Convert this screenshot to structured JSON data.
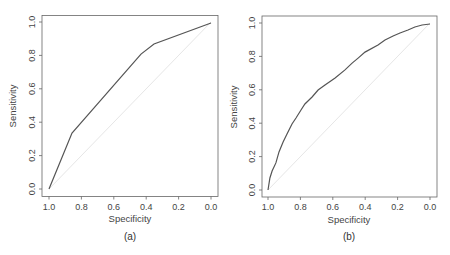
{
  "chart_data": [
    {
      "type": "line",
      "panel": "a",
      "caption": "(a)",
      "title": "",
      "xlabel": "Specificity",
      "ylabel": "Sensitivity",
      "xlim": [
        1.0,
        0.0
      ],
      "ylim": [
        0.0,
        1.0
      ],
      "x_reversed": true,
      "xticks": [
        "1.0",
        "0.8",
        "0.6",
        "0.4",
        "0.2",
        "0.0"
      ],
      "yticks": [
        "0.0",
        "0.2",
        "0.4",
        "0.6",
        "0.8",
        "1.0"
      ],
      "grid": false,
      "reference_line": {
        "from": [
          1.0,
          0.0
        ],
        "to": [
          0.0,
          1.0
        ],
        "color": "#e6e6e6"
      },
      "series": [
        {
          "name": "ROC",
          "color": "#555555",
          "specificity": [
            1.0,
            0.858,
            0.432,
            0.352,
            0.0
          ],
          "sensitivity": [
            0.0,
            0.335,
            0.808,
            0.868,
            0.994
          ]
        }
      ]
    },
    {
      "type": "line",
      "panel": "b",
      "caption": "(b)",
      "title": "",
      "xlabel": "Specificity",
      "ylabel": "Sensitivity",
      "xlim": [
        1.0,
        0.0
      ],
      "ylim": [
        0.0,
        1.0
      ],
      "x_reversed": true,
      "xticks": [
        "1.0",
        "0.8",
        "0.6",
        "0.4",
        "0.2",
        "0.0"
      ],
      "yticks": [
        "0.0",
        "0.2",
        "0.4",
        "0.6",
        "0.8",
        "1.0"
      ],
      "grid": false,
      "reference_line": {
        "from": [
          1.0,
          0.0
        ],
        "to": [
          0.0,
          1.0
        ],
        "color": "#e6e6e6"
      },
      "series": [
        {
          "name": "ROC",
          "color": "#555555",
          "specificity": [
            1.0,
            0.988,
            0.975,
            0.951,
            0.932,
            0.907,
            0.883,
            0.852,
            0.827,
            0.796,
            0.772,
            0.728,
            0.691,
            0.648,
            0.586,
            0.525,
            0.481,
            0.444,
            0.401,
            0.321,
            0.278,
            0.228,
            0.185,
            0.136,
            0.093,
            0.049,
            0.0
          ],
          "sensitivity": [
            0.0,
            0.072,
            0.114,
            0.162,
            0.228,
            0.287,
            0.335,
            0.395,
            0.431,
            0.479,
            0.515,
            0.557,
            0.599,
            0.629,
            0.671,
            0.719,
            0.76,
            0.79,
            0.826,
            0.868,
            0.898,
            0.922,
            0.94,
            0.958,
            0.976,
            0.988,
            0.994
          ]
        }
      ]
    }
  ]
}
